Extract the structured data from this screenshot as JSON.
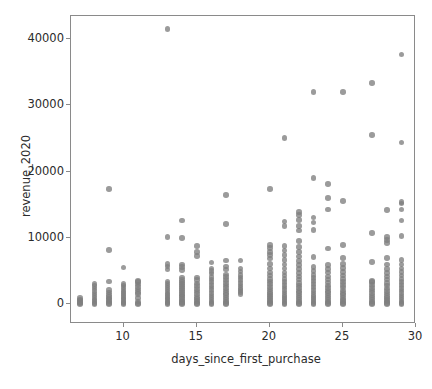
{
  "chart_data": {
    "type": "scatter",
    "title": "",
    "xlabel": "days_since_first_purchase",
    "ylabel": "revenue_2020",
    "xlim": [
      6.4,
      30.0
    ],
    "ylim": [
      -3000,
      43500
    ],
    "xticks": [
      10,
      15,
      20,
      25,
      30
    ],
    "xticklabels": [
      "10",
      "15",
      "20",
      "25",
      "30"
    ],
    "yticks": [
      0,
      10000,
      20000,
      30000,
      40000
    ],
    "yticklabels": [
      "0",
      "10000",
      "20000",
      "30000",
      "40000"
    ],
    "grid": false,
    "legend": null,
    "marker_color": "#7f7f7f",
    "marker_size": 6,
    "marker_alpha": 0.78,
    "columns": [
      {
        "x": 7,
        "y": [
          0,
          150,
          330,
          520,
          700,
          900
        ]
      },
      {
        "x": 8,
        "y": [
          0,
          200,
          450,
          700,
          1000,
          1300,
          1600,
          2000,
          2350,
          2700,
          3050
        ]
      },
      {
        "x": 9,
        "y": [
          0,
          180,
          400,
          620,
          850,
          1100,
          1400,
          1750,
          2100,
          3400,
          8200,
          17400
        ]
      },
      {
        "x": 10,
        "y": [
          0,
          150,
          350,
          600,
          850,
          1100,
          1350,
          1650,
          1900,
          2200,
          2500,
          2800,
          3050,
          5500
        ]
      },
      {
        "x": 11,
        "y": [
          0,
          120,
          400,
          900,
          1500,
          1800,
          2200,
          2600,
          2950,
          3300,
          3500
        ]
      },
      {
        "x": 13,
        "y": [
          0,
          150,
          350,
          600,
          850,
          1100,
          1350,
          1600,
          1900,
          2200,
          2500,
          2800,
          3100,
          3400,
          5200,
          5700,
          6100,
          10150,
          41500
        ]
      },
      {
        "x": 14,
        "y": [
          0,
          130,
          320,
          560,
          800,
          1050,
          1300,
          1550,
          1800,
          2100,
          2400,
          2700,
          3000,
          3300,
          3600,
          4000,
          5150,
          5600,
          6000,
          9950,
          12600
        ]
      },
      {
        "x": 15,
        "y": [
          0,
          200,
          500,
          800,
          1100,
          1500,
          1900,
          2300,
          2700,
          3100,
          3600,
          4000,
          7300,
          7900,
          8800
        ]
      },
      {
        "x": 16,
        "y": [
          0,
          150,
          400,
          700,
          1000,
          1300,
          1700,
          2100,
          2500,
          2900,
          3300,
          3700,
          4100,
          4600,
          5000,
          5400,
          6300
        ]
      },
      {
        "x": 17,
        "y": [
          0,
          180,
          420,
          700,
          1000,
          1350,
          1700,
          2050,
          2400,
          2800,
          3200,
          3600,
          4100,
          4500,
          5200,
          5700,
          6600,
          12100,
          16500
        ]
      },
      {
        "x": 18,
        "y": [
          1500,
          1800,
          2100,
          2400,
          2800,
          3200,
          3600,
          4000,
          4400,
          4900,
          5400,
          6600
        ]
      },
      {
        "x": 20,
        "y": [
          0,
          150,
          400,
          650,
          900,
          1200,
          1500,
          1800,
          2200,
          2600,
          3000,
          3400,
          3800,
          4300,
          4800,
          5400,
          6100,
          6900,
          7400,
          7900,
          8500,
          8900,
          17400
        ]
      },
      {
        "x": 21,
        "y": [
          0,
          200,
          450,
          750,
          1050,
          1400,
          1750,
          2100,
          2500,
          2900,
          3300,
          3800,
          4300,
          4800,
          5400,
          6000,
          6700,
          7400,
          8100,
          8800,
          11800,
          12500,
          25100
        ]
      },
      {
        "x": 22,
        "y": [
          0,
          160,
          420,
          700,
          1000,
          1300,
          1650,
          2000,
          2400,
          2800,
          3200,
          3700,
          4200,
          4700,
          5300,
          5900,
          6500,
          7200,
          7900,
          8600,
          9500,
          11100,
          11800,
          12700,
          13500,
          13900
        ]
      },
      {
        "x": 23,
        "y": [
          0,
          180,
          450,
          750,
          1050,
          1400,
          1750,
          2150,
          2550,
          3000,
          3450,
          3900,
          4400,
          5000,
          5600,
          7100,
          11200,
          12300,
          13100,
          19000,
          32000
        ]
      },
      {
        "x": 24,
        "y": [
          0,
          150,
          400,
          680,
          980,
          1300,
          1650,
          2000,
          2400,
          2800,
          3250,
          3700,
          4200,
          4750,
          5300,
          5900,
          8400,
          14300,
          16000,
          18100
        ]
      },
      {
        "x": 25,
        "y": [
          0,
          170,
          430,
          720,
          1020,
          1350,
          1700,
          2080,
          2480,
          2900,
          3350,
          3800,
          4300,
          4850,
          5450,
          6100,
          7000,
          8900,
          15600,
          32000
        ]
      },
      {
        "x": 27,
        "y": [
          0,
          160,
          410,
          690,
          990,
          1320,
          1670,
          2040,
          2440,
          2870,
          3320,
          3480,
          6400,
          10700,
          25500,
          33400
        ]
      },
      {
        "x": 28,
        "y": [
          0,
          150,
          390,
          660,
          950,
          1270,
          1610,
          1980,
          2370,
          2790,
          3230,
          3700,
          4200,
          4700,
          5300,
          6000,
          7000,
          9200,
          9700,
          10100,
          14200
        ]
      },
      {
        "x": 29,
        "y": [
          0,
          170,
          420,
          700,
          1000,
          1330,
          1680,
          2050,
          2450,
          2880,
          3330,
          3800,
          4300,
          4830,
          5400,
          6000,
          6700,
          10300,
          12600,
          14300,
          15200,
          15400,
          24400,
          37700
        ]
      }
    ]
  },
  "axes": {
    "x_label": "days_since_first_purchase",
    "y_label": "revenue_2020"
  }
}
